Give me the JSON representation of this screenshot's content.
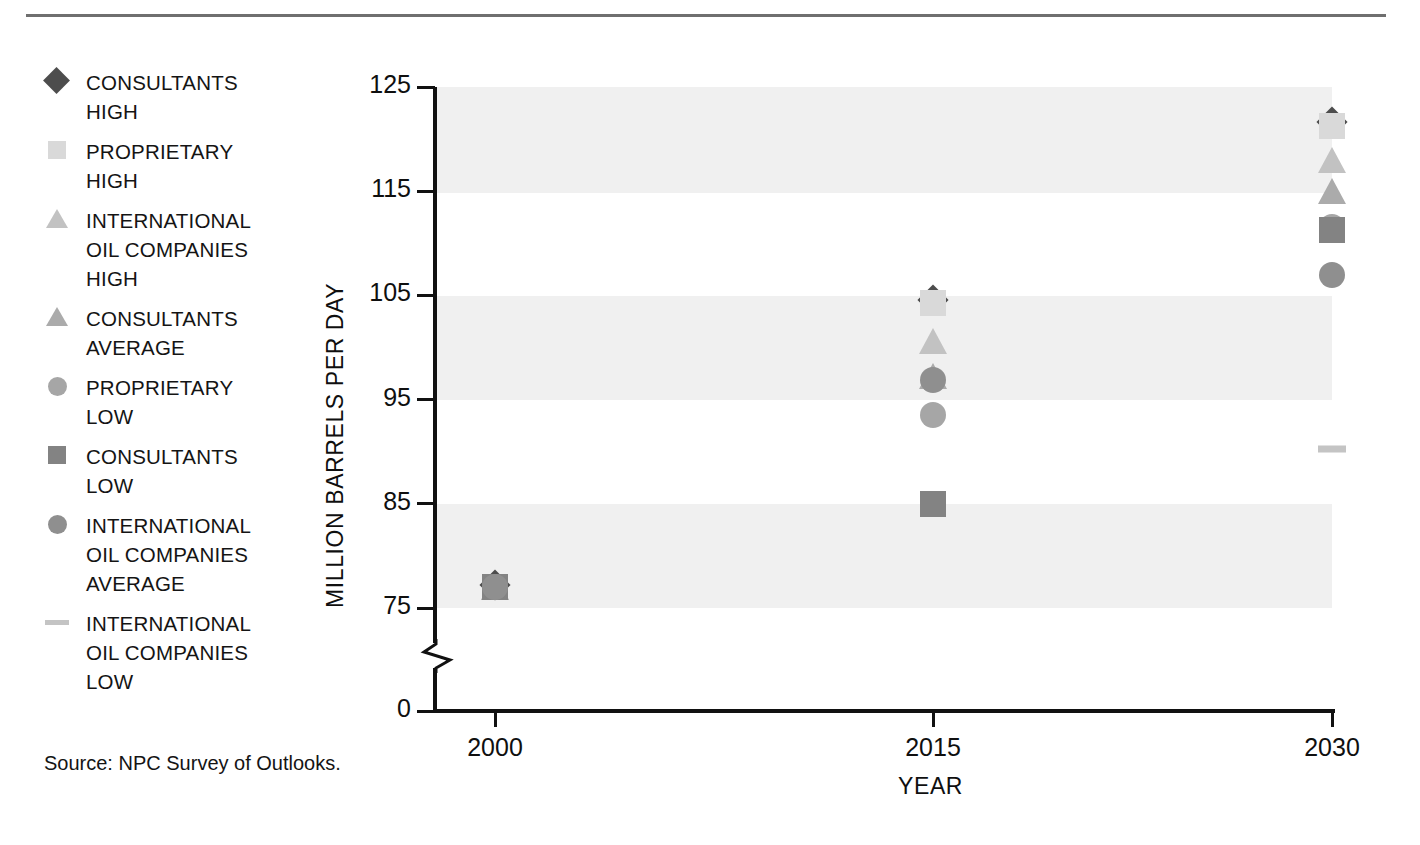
{
  "source_note": "Source:  NPC Survey of Outlooks.",
  "legend": {
    "items": [
      {
        "label": "CONSULTANTS\nHIGH",
        "marker": "diamond",
        "color": "#4d4d4d",
        "key": "consultants_high"
      },
      {
        "label": "PROPRIETARY\nHIGH",
        "marker": "square",
        "color": "#d9d9d9",
        "key": "proprietary_high"
      },
      {
        "label": "INTERNATIONAL\nOIL COMPANIES\nHIGH",
        "marker": "triangle",
        "color": "#c2c2c2",
        "key": "ioc_high"
      },
      {
        "label": "CONSULTANTS\nAVERAGE",
        "marker": "triangle",
        "color": "#ababab",
        "key": "consultants_average"
      },
      {
        "label": "PROPRIETARY\nLOW",
        "marker": "circle",
        "color": "#a6a6a6",
        "key": "proprietary_low"
      },
      {
        "label": "CONSULTANTS\nLOW",
        "marker": "square",
        "color": "#838383",
        "key": "consultants_low"
      },
      {
        "label": "INTERNATIONAL\nOIL COMPANIES\nAVERAGE",
        "marker": "circle",
        "color": "#8f8f8f",
        "key": "ioc_average"
      },
      {
        "label": "INTERNATIONAL\nOIL COMPANIES\nLOW",
        "marker": "dash",
        "color": "#c4c4c4",
        "key": "ioc_low"
      }
    ]
  },
  "chart_data": {
    "type": "scatter",
    "title": "",
    "xlabel": "YEAR",
    "ylabel": "MILLION BARRELS PER DAY",
    "x": [
      2000,
      2015,
      2030
    ],
    "xtick_labels": [
      "2000",
      "2015",
      "2030"
    ],
    "ytick_labels": [
      "125",
      "115",
      "105",
      "95",
      "85",
      "75",
      "0"
    ],
    "ytick_values": [
      125,
      115,
      105,
      95,
      85,
      75,
      0
    ],
    "ylim": [
      75,
      125
    ],
    "y_axis_break": true,
    "grid": false,
    "banded_background": true,
    "bands": [
      [
        115,
        125
      ],
      [
        95,
        105
      ],
      [
        75,
        85
      ]
    ],
    "legend_position": "left-outside",
    "series": [
      {
        "name": "CONSULTANTS HIGH",
        "marker": "diamond",
        "color": "#4d4d4d",
        "points": [
          {
            "x": 2000,
            "y": 77.2
          },
          {
            "x": 2015,
            "y": 104.6
          },
          {
            "x": 2030,
            "y": 121.6
          }
        ]
      },
      {
        "name": "PROPRIETARY HIGH",
        "marker": "square",
        "color": "#d9d9d9",
        "points": [
          {
            "x": 2000,
            "y": 77.0
          },
          {
            "x": 2015,
            "y": 104.3
          },
          {
            "x": 2030,
            "y": 121.3
          }
        ]
      },
      {
        "name": "INTERNATIONAL OIL COMPANIES HIGH",
        "marker": "triangle",
        "color": "#c2c2c2",
        "points": [
          {
            "x": 2000,
            "y": 77.0
          },
          {
            "x": 2015,
            "y": 100.6
          },
          {
            "x": 2030,
            "y": 118.0
          }
        ]
      },
      {
        "name": "CONSULTANTS AVERAGE",
        "marker": "triangle",
        "color": "#ababab",
        "points": [
          {
            "x": 2000,
            "y": 77.0
          },
          {
            "x": 2015,
            "y": 97.3
          },
          {
            "x": 2030,
            "y": 115.0
          }
        ]
      },
      {
        "name": "PROPRIETARY LOW",
        "marker": "circle",
        "color": "#a6a6a6",
        "points": [
          {
            "x": 2000,
            "y": 77.0
          },
          {
            "x": 2015,
            "y": 93.5
          },
          {
            "x": 2030,
            "y": 111.6
          }
        ]
      },
      {
        "name": "CONSULTANTS LOW",
        "marker": "square",
        "color": "#838383",
        "points": [
          {
            "x": 2000,
            "y": 77.0
          },
          {
            "x": 2015,
            "y": 85.0
          },
          {
            "x": 2030,
            "y": 111.3
          }
        ]
      },
      {
        "name": "INTERNATIONAL OIL COMPANIES AVERAGE",
        "marker": "circle",
        "color": "#8f8f8f",
        "points": [
          {
            "x": 2000,
            "y": 77.0
          },
          {
            "x": 2015,
            "y": 96.9
          },
          {
            "x": 2030,
            "y": 107.0
          }
        ]
      },
      {
        "name": "INTERNATIONAL OIL COMPANIES LOW",
        "marker": "dash",
        "color": "#c4c4c4",
        "points": [
          {
            "x": 2030,
            "y": 90.3
          }
        ]
      }
    ]
  }
}
